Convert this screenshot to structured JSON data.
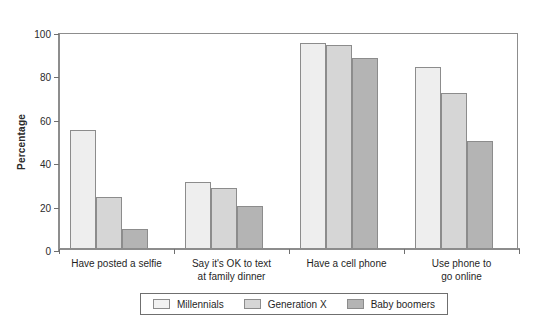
{
  "chart_data": {
    "type": "bar",
    "title": "",
    "subtitle": "",
    "xlabel": "",
    "ylabel": "Percentage",
    "ylim": [
      0,
      100
    ],
    "yticks": [
      0,
      20,
      40,
      60,
      80,
      100
    ],
    "ytick_labels": [
      "0",
      "20",
      "40",
      "60",
      "80",
      "100"
    ],
    "grid": false,
    "legend_position": "bottom",
    "categories": [
      "Have posted a selfie",
      "Say it's OK to text\nat family dinner",
      "Have a cell phone",
      "Use phone to\ngo online"
    ],
    "series": [
      {
        "name": "Millennials",
        "color": "#eeeeee",
        "values": [
          55,
          31,
          95,
          84
        ]
      },
      {
        "name": "Generation X",
        "color": "#d6d6d6",
        "values": [
          24,
          28,
          94,
          72
        ]
      },
      {
        "name": "Baby boomers",
        "color": "#b4b4b4",
        "values": [
          9,
          20,
          88,
          50
        ]
      }
    ]
  },
  "legend": {
    "items": [
      {
        "label": "Millennials"
      },
      {
        "label": "Generation X"
      },
      {
        "label": "Baby boomers"
      }
    ]
  },
  "colors": {
    "series_1": "#eeeeee",
    "series_2": "#d6d6d6",
    "series_3": "#b4b4b4",
    "axis": "#8d8d8d",
    "text": "#1f1f1f",
    "background": "#ffffff"
  }
}
